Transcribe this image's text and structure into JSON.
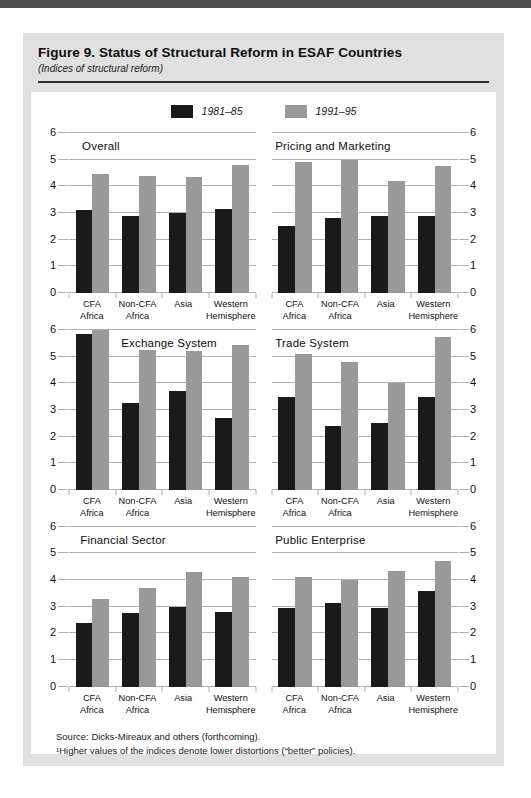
{
  "header": {
    "figure_title": "Figure 9.  Status of Structural Reform in ESAF Countries",
    "subtitle": "(Indices of structural reform)"
  },
  "legend": {
    "items": [
      {
        "label": "1981–85",
        "color": "#1a1a1a"
      },
      {
        "label": "1991–95",
        "color": "#999999"
      }
    ]
  },
  "notes": {
    "source": "Source: Dicks-Mireaux and others (forthcoming).",
    "footnote": "¹Higher values of the indices denote lower distortions (“better” policies)."
  },
  "colors": {
    "top_bar": "#4d4d4d",
    "panel_bg": "#e0e0e0",
    "series_1981": "#1a1a1a",
    "series_1991": "#999999",
    "gridline": "#b0b0b0"
  },
  "chart_data": [
    {
      "type": "bar",
      "title": "Overall",
      "categories": [
        "CFA\nAfrica",
        "Non-CFA\nAfrica",
        "Asia",
        "Western\nHemisphere"
      ],
      "series": [
        {
          "name": "1981–85",
          "values": [
            3.1,
            2.9,
            3.0,
            3.15
          ]
        },
        {
          "name": "1991–95",
          "values": [
            4.45,
            4.4,
            4.35,
            4.8
          ]
        }
      ],
      "ylim": [
        0,
        6
      ],
      "yticks": [
        0,
        1,
        2,
        3,
        4,
        5,
        6
      ],
      "axis_side": "left",
      "title_indent_pct": 7
    },
    {
      "type": "bar",
      "title": "Pricing and Marketing",
      "categories": [
        "CFA\nAfrica",
        "Non-CFA\nAfrica",
        "Asia",
        "Western\nHemisphere"
      ],
      "series": [
        {
          "name": "1981–85",
          "values": [
            2.5,
            2.8,
            2.9,
            2.9
          ]
        },
        {
          "name": "1991–95",
          "values": [
            4.9,
            5.0,
            4.2,
            4.75
          ]
        }
      ],
      "ylim": [
        0,
        6
      ],
      "yticks": [
        0,
        1,
        2,
        3,
        4,
        5,
        6
      ],
      "axis_side": "right",
      "title_indent_pct": 2
    },
    {
      "type": "bar",
      "title": "Exchange System",
      "categories": [
        "CFA\nAfrica",
        "Non-CFA\nAfrica",
        "Asia",
        "Western\nHemisphere"
      ],
      "series": [
        {
          "name": "1981–85",
          "values": [
            5.85,
            3.25,
            3.7,
            2.7
          ]
        },
        {
          "name": "1991–95",
          "values": [
            6.0,
            5.25,
            5.2,
            5.45
          ]
        }
      ],
      "ylim": [
        0,
        6
      ],
      "yticks": [
        0,
        1,
        2,
        3,
        4,
        5,
        6
      ],
      "axis_side": "left",
      "title_indent_pct": 28
    },
    {
      "type": "bar",
      "title": "Trade System",
      "categories": [
        "CFA\nAfrica",
        "Non-CFA\nAfrica",
        "Asia",
        "Western\nHemisphere"
      ],
      "series": [
        {
          "name": "1981–85",
          "values": [
            3.5,
            2.4,
            2.5,
            3.5
          ]
        },
        {
          "name": "1991–95",
          "values": [
            5.1,
            4.8,
            4.0,
            5.75
          ]
        }
      ],
      "ylim": [
        0,
        6
      ],
      "yticks": [
        0,
        1,
        2,
        3,
        4,
        5,
        6
      ],
      "axis_side": "right",
      "title_indent_pct": 2
    },
    {
      "type": "bar",
      "title": "Financial Sector",
      "categories": [
        "CFA\nAfrica",
        "Non-CFA\nAfrica",
        "Asia",
        "Western\nHemisphere"
      ],
      "series": [
        {
          "name": "1981–85",
          "values": [
            2.4,
            2.75,
            3.0,
            2.8
          ]
        },
        {
          "name": "1991–95",
          "values": [
            3.3,
            3.7,
            4.3,
            4.1
          ]
        }
      ],
      "ylim": [
        0,
        6
      ],
      "yticks": [
        0,
        1,
        2,
        3,
        4,
        5,
        6
      ],
      "axis_side": "left",
      "title_indent_pct": 6
    },
    {
      "type": "bar",
      "title": "Public Enterprise",
      "categories": [
        "CFA\nAfrica",
        "Non-CFA\nAfrica",
        "Asia",
        "Western\nHemisphere"
      ],
      "series": [
        {
          "name": "1981–85",
          "values": [
            2.95,
            3.15,
            2.95,
            3.6
          ]
        },
        {
          "name": "1991–95",
          "values": [
            4.1,
            4.0,
            4.35,
            4.7
          ]
        }
      ],
      "ylim": [
        0,
        6
      ],
      "yticks": [
        0,
        1,
        2,
        3,
        4,
        5,
        6
      ],
      "axis_side": "right",
      "title_indent_pct": 2
    }
  ]
}
